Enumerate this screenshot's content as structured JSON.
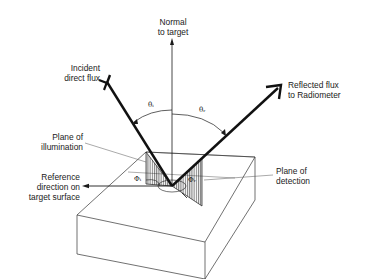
{
  "diagram": {
    "labels": {
      "normal": [
        "Normal",
        "to target"
      ],
      "incident": [
        "Incident",
        "direct flux"
      ],
      "reflected": [
        "Reflected flux",
        "to Radiometer"
      ],
      "plane_illumination": [
        "Plane of",
        "illumination"
      ],
      "reference": [
        "Reference",
        "direction on",
        "target surface"
      ],
      "plane_detection": [
        "Plane of",
        "detection"
      ]
    },
    "symbols": {
      "theta_i": "θᵢ",
      "theta_r": "θᵣ",
      "phi_i": "Φᵢ",
      "phi_r": "Φᵣ"
    },
    "colors": {
      "line": "#1a1a1a",
      "box_line": "#333333",
      "background": "#ffffff"
    }
  }
}
